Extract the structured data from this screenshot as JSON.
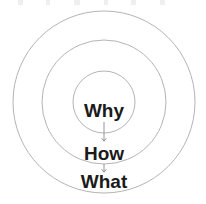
{
  "diagram": {
    "type": "concentric-circles",
    "background_color": "#ffffff",
    "ring_stroke_color": "#b4b4b4",
    "ring_stroke_width": 1,
    "label_color": "#1a1a1a",
    "arrow_color": "#8a8a8a",
    "center": {
      "x": 104,
      "y": 102
    },
    "rings": [
      {
        "name": "outer-ring",
        "radius": 91,
        "label": "What"
      },
      {
        "name": "middle-ring",
        "radius": 62,
        "label": "How"
      },
      {
        "name": "inner-ring",
        "radius": 31,
        "label": "Why"
      }
    ],
    "labels": [
      {
        "name": "why",
        "text": "Why",
        "x": 104,
        "y": 117,
        "font_size": 19
      },
      {
        "name": "how",
        "text": "How",
        "x": 104,
        "y": 160,
        "font_size": 19
      },
      {
        "name": "what",
        "text": "What",
        "x": 104,
        "y": 188,
        "font_size": 19
      }
    ],
    "arrows": [
      {
        "name": "why-to-how",
        "x": 104,
        "y1": 122,
        "y2": 141
      },
      {
        "name": "how-to-what",
        "x": 104,
        "y1": 164,
        "y2": 172
      }
    ]
  }
}
